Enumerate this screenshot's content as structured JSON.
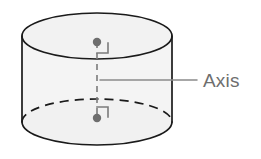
{
  "figure": {
    "kind": "geometry-diagram",
    "canvas": {
      "width": 261,
      "height": 159,
      "background": "#ffffff"
    },
    "shape": {
      "name": "cylinder",
      "center_x": 97,
      "left_x": 22,
      "right_x": 172,
      "radius_x": 75,
      "radius_y": 23,
      "top_ellipse_center_y": 36,
      "bottom_ellipse_center_y": 122,
      "fill_color": "#f4f4f4",
      "stroke_color": "#1a1a1a",
      "stroke_width": 1.6,
      "hidden_edge_style": "dashed"
    },
    "axis": {
      "label": "Axis",
      "label_x": 203,
      "label_baseline_y": 87,
      "label_color": "#6e6e6e",
      "line_color": "#7a7a7a",
      "line_style": "dashed",
      "line_x": 97,
      "line_top_y": 42,
      "line_bottom_y": 118,
      "endpoints": [
        {
          "name": "top-vertex",
          "x": 97,
          "y": 42
        },
        {
          "name": "bottom-vertex",
          "x": 97,
          "y": 118
        }
      ],
      "dot_radius": 4,
      "dot_color": "#6e6e6e",
      "right_angle_marks": [
        {
          "name": "top-right-angle",
          "x": 97,
          "y": 42,
          "size": 11,
          "direction": "down-right"
        },
        {
          "name": "bottom-right-angle",
          "x": 97,
          "y": 118,
          "size": 11,
          "direction": "up-right"
        }
      ],
      "leader_line": {
        "x1": 100,
        "y1": 80,
        "x2": 197,
        "y2": 80,
        "color": "#8a8a8a"
      }
    }
  }
}
